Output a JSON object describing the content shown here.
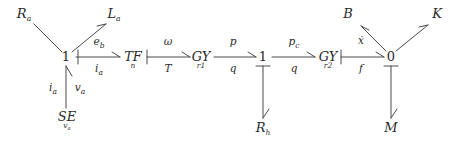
{
  "diagram": {
    "kind": "bond-graph",
    "title": "",
    "stroke_color": "#4a4a4a",
    "text_color": "#2b2b2b",
    "background": "#ffffff",
    "junctions": [
      {
        "id": "j1",
        "label": "1",
        "x": 66,
        "y": 58
      },
      {
        "id": "j2",
        "label": "1",
        "x": 263,
        "y": 58
      },
      {
        "id": "j3",
        "label": "0",
        "x": 391,
        "y": 58
      }
    ],
    "elements": [
      {
        "id": "Ra",
        "label": "R",
        "sub": "a",
        "x": 24,
        "y": 14
      },
      {
        "id": "La",
        "label": "L",
        "sub": "a",
        "x": 113,
        "y": 14
      },
      {
        "id": "SE",
        "label": "SE",
        "sub": "v a",
        "x": 74,
        "y": 117
      },
      {
        "id": "TF",
        "label": "TF",
        "sub": "n",
        "x": 133,
        "y": 57
      },
      {
        "id": "GY1",
        "label": "GY",
        "sub": "r 1",
        "x": 200,
        "y": 57
      },
      {
        "id": "Rh",
        "label": "R",
        "sub": "h",
        "x": 263,
        "y": 128
      },
      {
        "id": "GY2",
        "label": "GY",
        "sub": "r 2",
        "x": 327,
        "y": 57
      },
      {
        "id": "B",
        "label": "B",
        "sub": "",
        "x": 348,
        "y": 14
      },
      {
        "id": "K",
        "label": "K",
        "sub": "",
        "x": 437,
        "y": 14
      },
      {
        "id": "M",
        "label": "M",
        "sub": "",
        "x": 391,
        "y": 128
      }
    ],
    "bond_labels": [
      {
        "id": "bond-ra",
        "effort": "",
        "flow": "",
        "text": ""
      },
      {
        "id": "bond-eb",
        "effort": "e",
        "effort_sub": "b",
        "flow": "i",
        "flow_sub": "a",
        "x": 99,
        "y_e": 43,
        "y_f": 70
      },
      {
        "id": "bond-wt",
        "effort": "ω",
        "effort_sub": "",
        "flow": "T",
        "flow_sub": "",
        "x": 167,
        "y_e": 43,
        "y_f": 70
      },
      {
        "id": "bond-pq",
        "effort": "p",
        "effort_sub": "",
        "flow": "q",
        "flow_sub": "",
        "x": 232,
        "y_e": 43,
        "y_f": 70
      },
      {
        "id": "bond-pcq",
        "effort": "p",
        "effort_sub": "c",
        "flow": "q",
        "flow_sub": "",
        "x": 295,
        "y_e": 43,
        "y_f": 70
      },
      {
        "id": "bond-xf",
        "effort": "ẋ",
        "effort_sub": "",
        "flow": "f",
        "flow_sub": "",
        "x": 360,
        "y_e": 43,
        "y_f": 70
      },
      {
        "id": "bond-iava-i",
        "text": "i",
        "sub": "a",
        "x": 52,
        "y": 88
      },
      {
        "id": "bond-iava-v",
        "text": "v",
        "sub": "a",
        "x": 76,
        "y": 88
      }
    ],
    "bonds": [
      {
        "id": "b-1-Ra",
        "from": "j1",
        "to": "Ra",
        "causal_stroke": "none",
        "arrow": "half"
      },
      {
        "id": "b-1-La",
        "from": "j1",
        "to": "La",
        "causal_stroke": "none",
        "arrow": "half"
      },
      {
        "id": "b-SE-1",
        "from": "SE",
        "to": "j1",
        "causal_stroke": "none",
        "arrow": "half"
      },
      {
        "id": "b-1-TF",
        "from": "j1",
        "to": "TF",
        "causal_stroke": "source",
        "arrow": "half"
      },
      {
        "id": "b-TF-GY1",
        "from": "TF",
        "to": "GY1",
        "causal_stroke": "source",
        "arrow": "half"
      },
      {
        "id": "b-GY1-1",
        "from": "GY1",
        "to": "j2",
        "causal_stroke": "none",
        "arrow": "half"
      },
      {
        "id": "b-1-GY2",
        "from": "j2",
        "to": "GY2",
        "causal_stroke": "none",
        "arrow": "half"
      },
      {
        "id": "b-1-Rh",
        "from": "j2",
        "to": "Rh",
        "causal_stroke": "source",
        "arrow": "half"
      },
      {
        "id": "b-GY2-0",
        "from": "GY2",
        "to": "j3",
        "causal_stroke": "source",
        "arrow": "half"
      },
      {
        "id": "b-0-B",
        "from": "j3",
        "to": "B",
        "causal_stroke": "none",
        "arrow": "half"
      },
      {
        "id": "b-0-K",
        "from": "j3",
        "to": "K",
        "causal_stroke": "none",
        "arrow": "half"
      },
      {
        "id": "b-0-M",
        "from": "j3",
        "to": "M",
        "causal_stroke": "source",
        "arrow": "half"
      }
    ]
  },
  "labels": {
    "Ra_main": "R",
    "Ra_sub": "a",
    "La_main": "L",
    "La_sub": "a",
    "SE_main": "SE",
    "SE_sub": "v",
    "SE_sub_sub": "a",
    "TF_main": "TF",
    "TF_sub": "n",
    "GY1_main": "GY",
    "GY1_sub": "r",
    "GY1_sub_sub": "1",
    "GY2_main": "GY",
    "GY2_sub": "r",
    "GY2_sub_sub": "2",
    "Rh_main": "R",
    "Rh_sub": "h",
    "B_main": "B",
    "K_main": "K",
    "M_main": "M",
    "j1": "1",
    "j2": "1",
    "j3": "0",
    "eb_e": "e",
    "eb_e_sub": "b",
    "eb_f": "i",
    "eb_f_sub": "a",
    "wt_e": "ω",
    "wt_f": "T",
    "pq_e": "p",
    "pq_f": "q",
    "pcq_e": "p",
    "pcq_e_sub": "c",
    "pcq_f": "q",
    "xf_e": "ẋ",
    "xf_f": "f",
    "ia_left": "i",
    "ia_left_sub": "a",
    "va_right": "v",
    "va_right_sub": "a"
  }
}
